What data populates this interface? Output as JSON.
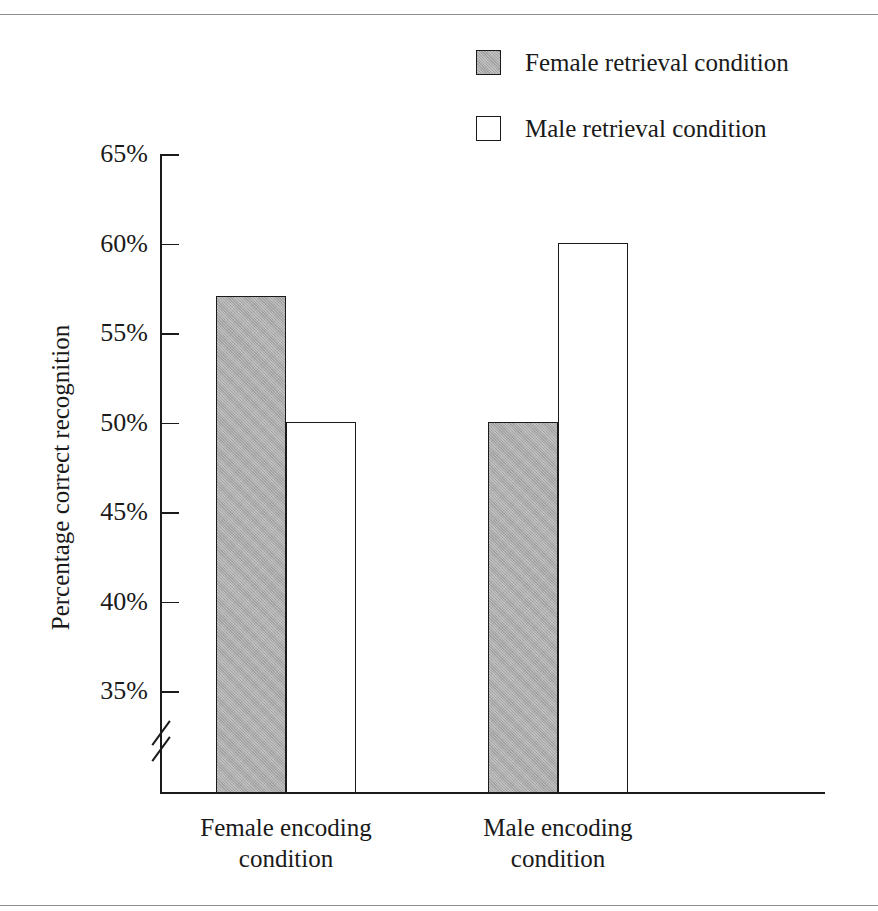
{
  "figure": {
    "title_fragment": "",
    "background_color": "#ffffff",
    "rule_color": "#8e8e8e"
  },
  "legend": {
    "position": "top-right",
    "items": [
      {
        "label": "Female retrieval condition",
        "swatch": "filled-gray-square",
        "color": "#a9a9a9"
      },
      {
        "label": "Male retrieval condition",
        "swatch": "hollow-white-square",
        "color": "#ffffff"
      }
    ]
  },
  "axes": {
    "y_title": "Percentage correct recognition",
    "y_ticks": [
      "65%",
      "60%",
      "55%",
      "50%",
      "45%",
      "40%",
      "35%"
    ],
    "y_tick_values": [
      65,
      60,
      55,
      50,
      45,
      40,
      35
    ],
    "axis_break": "broken-axis-marker",
    "x_labels": [
      {
        "line1": "Female encoding",
        "line2": "condition"
      },
      {
        "line1": "Male encoding",
        "line2": "condition"
      }
    ]
  },
  "chart_data": {
    "type": "bar",
    "title": "",
    "xlabel": "",
    "ylabel": "Percentage correct recognition",
    "categories": [
      "Female encoding condition",
      "Male encoding condition"
    ],
    "series": [
      {
        "name": "Female retrieval condition",
        "values": [
          57.1,
          50.1
        ],
        "color": "#a9a9a9"
      },
      {
        "name": "Male retrieval condition",
        "values": [
          50.1,
          60.1
        ],
        "color": "#ffffff"
      }
    ],
    "ylim": [
      32,
      65
    ],
    "ytick_step": 5,
    "y_unit": "%",
    "grid": false,
    "legend_position": "top-right",
    "axis_broken": true,
    "bars_adjacent": true
  },
  "geometry": {
    "plot_left": 160,
    "plot_baseline": 792,
    "y_top_value": 65,
    "y_top_pixel": 155,
    "pixels_per_5pct": 89.5,
    "bars": [
      {
        "left": 216,
        "width": 70,
        "series": 0,
        "group": 0
      },
      {
        "left": 286,
        "width": 70,
        "series": 1,
        "group": 0
      },
      {
        "left": 488,
        "width": 70,
        "series": 0,
        "group": 1
      },
      {
        "left": 558,
        "width": 70,
        "series": 1,
        "group": 1
      }
    ],
    "group_label_centers": [
      286,
      558
    ]
  }
}
